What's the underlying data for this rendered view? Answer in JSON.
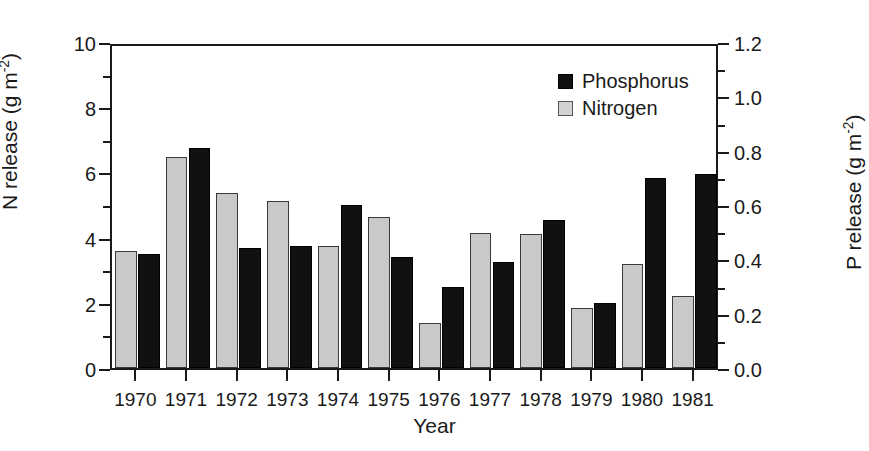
{
  "chart_data": {
    "type": "bar",
    "title": "",
    "xlabel": "Year",
    "ylabel": "N release (g m-2)",
    "ylabel_right": "P release (g m-2)",
    "categories": [
      "1970",
      "1971",
      "1972",
      "1973",
      "1974",
      "1975",
      "1976",
      "1977",
      "1978",
      "1979",
      "1980",
      "1981"
    ],
    "series": [
      {
        "name": "Nitrogen",
        "axis": "left",
        "color": "#c9c9c9",
        "values": [
          3.58,
          6.48,
          5.36,
          5.12,
          3.74,
          4.64,
          1.38,
          4.14,
          4.12,
          1.84,
          3.2,
          2.22
        ]
      },
      {
        "name": "Phosphorus",
        "axis": "right",
        "color": "#111111",
        "values": [
          0.42,
          0.81,
          0.44,
          0.45,
          0.6,
          0.41,
          0.3,
          0.39,
          0.545,
          0.24,
          0.7,
          0.715
        ]
      }
    ],
    "ylim": [
      0,
      10
    ],
    "ylim_right": [
      0,
      1.2
    ],
    "yticks": [
      "0",
      "2",
      "4",
      "6",
      "8",
      "10"
    ],
    "yticks_right": [
      "0.0",
      "0.2",
      "0.4",
      "0.6",
      "0.8",
      "1.0",
      "1.2"
    ],
    "minor_ticks": true,
    "grid": false,
    "legend_position": "top-right",
    "legend": [
      "Phosphorus",
      "Nitrogen"
    ]
  },
  "axes": {
    "left": {
      "title_main": "N release (g m",
      "title_sup": "-2",
      "title_close": ")",
      "ticks": [
        "10",
        "8",
        "6",
        "4",
        "2",
        "0"
      ]
    },
    "right": {
      "title_main": "P release (g m",
      "title_sup": "-2",
      "title_close": ")",
      "ticks": [
        "1.2",
        "1.0",
        "0.8",
        "0.6",
        "0.4",
        "0.2",
        "0.0"
      ]
    },
    "bottom": {
      "title": "Year",
      "ticks": [
        "1970",
        "1971",
        "1972",
        "1973",
        "1974",
        "1975",
        "1976",
        "1977",
        "1978",
        "1979",
        "1980",
        "1981"
      ]
    }
  },
  "legend": {
    "items": [
      {
        "label": "Phosphorus",
        "swatch": "black-square"
      },
      {
        "label": "Nitrogen",
        "swatch": "gray-square"
      }
    ]
  }
}
